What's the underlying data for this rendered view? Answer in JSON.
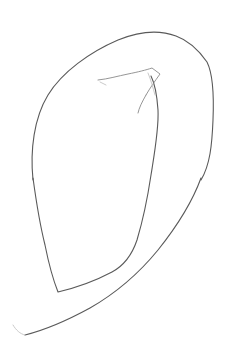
{
  "image": {
    "description": "Hand-drawn pencil line sketch of a leaf-like closed loop with an inner pointed shape and a sweeping lower stroke on a white background",
    "background_color": "#ffffff",
    "stroke_color": "#5a5a5a",
    "strokes": [
      {
        "name": "outer-loop-stroke",
        "tone": "main"
      },
      {
        "name": "lower-sweep-stroke",
        "tone": "main"
      },
      {
        "name": "inner-shape-stroke",
        "tone": "main"
      },
      {
        "name": "top-spike-stroke",
        "tone": "light"
      },
      {
        "name": "spike-tail-stroke",
        "tone": "light"
      },
      {
        "name": "lower-sweep-tail-stroke",
        "tone": "faint"
      }
    ]
  }
}
